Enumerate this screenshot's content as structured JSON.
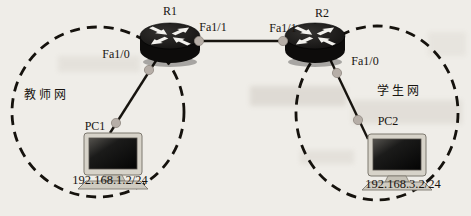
{
  "diagram": {
    "routers": {
      "r1": {
        "name": "R1"
      },
      "r2": {
        "name": "R2"
      }
    },
    "pcs": {
      "pc1": {
        "name": "PC1",
        "ip": "192.168.1.2/24"
      },
      "pc2": {
        "name": "PC2",
        "ip": "192.168.3.2/24"
      }
    },
    "zones": {
      "teacher": {
        "label": "教师网"
      },
      "student": {
        "label": "学生网"
      }
    },
    "links": [
      {
        "from": "R1",
        "from_if": "Fa1/1",
        "to": "R2",
        "to_if": "Fa1/1"
      },
      {
        "from": "R1",
        "from_if": "Fa1/0",
        "to": "PC1"
      },
      {
        "from": "R2",
        "from_if": "Fa1/0",
        "to": "PC2"
      }
    ]
  },
  "colors": {
    "page_background": "#efede8",
    "line": "#17140f",
    "dashed_boundary": "#15120d",
    "port_dot": "#b6aea7",
    "port_dot_edge": "#8f8880",
    "router_body": "#0d0c0b",
    "router_top": "#1d1c1a",
    "router_arrow": "#f2f1ed",
    "router_shadow": "#000000",
    "label_text": "#181410",
    "monitor_frame": "#d7d3c9",
    "monitor_edge": "#7d786f",
    "pc_base": "#cfcbc1",
    "pc_pedestal": "#c6c2b7"
  }
}
